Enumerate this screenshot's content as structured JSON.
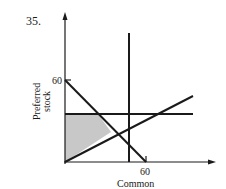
{
  "problem_number": "35.",
  "diagram": {
    "x_axis_label": "Common",
    "y_axis_label_line1": "Preferred",
    "y_axis_label_line2": "stock",
    "x_tick_label": "60",
    "y_tick_label": "60",
    "shaded_region": "feasible region",
    "shade_color": "#c8c8c8",
    "line_color": "#1a1a1a"
  }
}
